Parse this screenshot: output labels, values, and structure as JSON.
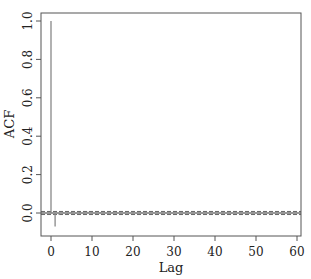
{
  "chart_data": {
    "type": "bar",
    "subtype": "acf",
    "title": "",
    "xlabel": "Lag",
    "ylabel": "ACF",
    "xlim": [
      -2,
      61
    ],
    "ylim": [
      -0.1,
      1.05
    ],
    "xticks": [
      0,
      10,
      20,
      30,
      40,
      50,
      60
    ],
    "yticks": [
      0.0,
      0.2,
      0.4,
      0.6,
      0.8,
      1.0
    ],
    "ytick_labels": [
      "0.0",
      "0.2",
      "0.4",
      "0.6",
      "0.8",
      "1.0"
    ],
    "xtick_labels": [
      "0",
      "10",
      "20",
      "30",
      "40",
      "50",
      "60"
    ],
    "grid": false,
    "lags": [
      0,
      1,
      2,
      3,
      4,
      5,
      6,
      7,
      8,
      9,
      10,
      11,
      12,
      13,
      14,
      15,
      16,
      17,
      18,
      19,
      20,
      21,
      22,
      23,
      24,
      25,
      26,
      27,
      28,
      29,
      30,
      31,
      32,
      33,
      34,
      35,
      36,
      37,
      38,
      39,
      40,
      41,
      42,
      43,
      44,
      45,
      46,
      47,
      48,
      49,
      50,
      51,
      52,
      53,
      54,
      55,
      56,
      57,
      58,
      59,
      60
    ],
    "values": [
      1.0,
      -0.07,
      -0.01,
      0.004,
      -0.005,
      0.006,
      -0.003,
      0.005,
      -0.004,
      0.006,
      0.003,
      -0.004,
      0.005,
      0.002,
      -0.003,
      0.004,
      0.002,
      -0.002,
      0.003,
      0.001,
      0.002,
      -0.002,
      0.003,
      0.001,
      -0.001,
      0.002,
      0.001,
      -0.002,
      0.002,
      0.001,
      0.001,
      -0.001,
      0.002,
      0.001,
      -0.001,
      0.001,
      0.001,
      -0.001,
      0.001,
      0.001,
      0.001,
      -0.001,
      0.001,
      0.001,
      -0.001,
      0.001,
      0.001,
      -0.001,
      0.001,
      0.001,
      0.001,
      -0.001,
      0.001,
      0.001,
      -0.001,
      0.001,
      0.001,
      -0.001,
      0.001,
      0.001,
      0.001
    ],
    "confidence_band": [
      -0.008,
      0.008
    ],
    "zero_line": true,
    "legend": null
  }
}
